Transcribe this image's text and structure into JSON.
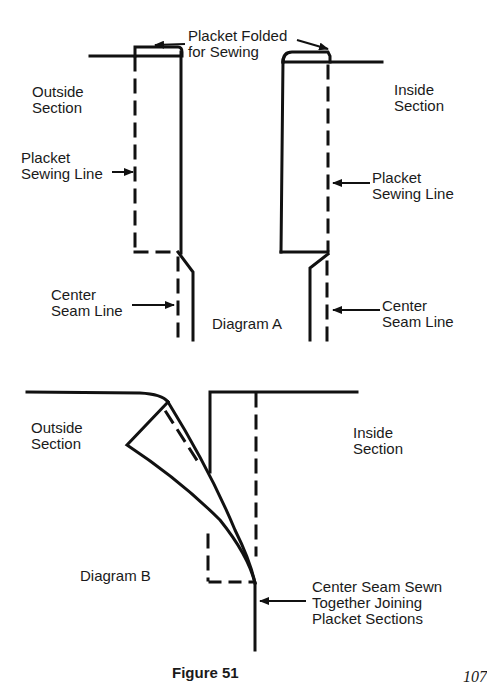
{
  "diagram_a": {
    "title": "Diagram A",
    "labels": {
      "placket_folded": "Placket Folded\nfor Sewing",
      "outside_section": "Outside\nSection",
      "inside_section": "Inside\nSection",
      "placket_sewing_line_left": "Placket\nSewing Line",
      "placket_sewing_line_right": "Placket\nSewing Line",
      "center_seam_line_left": "Center\nSeam Line",
      "center_seam_line_right": "Center\nSeam Line"
    }
  },
  "diagram_b": {
    "title": "Diagram B",
    "labels": {
      "outside_section": "Outside\nSection",
      "inside_section": "Inside\nSection",
      "center_seam_sewn": "Center Seam Sewn\nTogether Joining\nPlacket Sections"
    }
  },
  "caption": "Figure 51",
  "page_number": "107",
  "colors": {
    "ink": "#111111",
    "paper": "#ffffff"
  }
}
